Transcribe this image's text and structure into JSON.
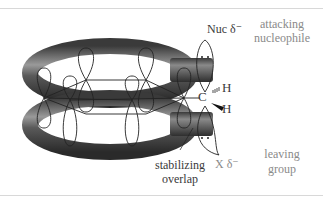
{
  "diagram": {
    "labels": {
      "nucleophile": "Nuc δ⁻",
      "attacking": "attacking",
      "nucleophile_word": "nucleophile",
      "carbon": "C",
      "h_top": "H",
      "h_bottom": "H",
      "leaving_atom": "X δ⁻",
      "leaving": "leaving",
      "group": "group",
      "stabilizing": "stabilizing",
      "overlap": "overlap"
    },
    "colors": {
      "tube": "#4a4a4a",
      "tube_highlight": "#a8a8a8",
      "label_gray": "#8a8a8a",
      "label_dark": "#3a3a3a",
      "orbital_stroke": "#222222"
    }
  }
}
